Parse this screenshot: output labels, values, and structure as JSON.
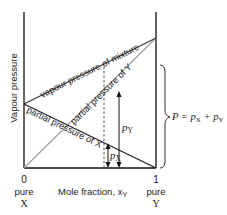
{
  "diagram": {
    "type": "vapour-pressure-composition diagram (ideal binary mixture, Raoult's law)",
    "y_axis": {
      "label": "Vapour pressure"
    },
    "x_axis": {
      "label": "Mole fraction, x",
      "label_subscript": "Y",
      "left_tick": {
        "value": "0",
        "component_line1": "pure",
        "component_line2": "X"
      },
      "right_tick": {
        "value": "1",
        "component_line1": "pure",
        "component_line2": "Y"
      }
    },
    "lines": [
      {
        "id": "total",
        "label": "vapour pressure of mixture",
        "color": "#333333"
      },
      {
        "id": "partial_y",
        "label": "partial pressure of Y",
        "color": "#999999"
      },
      {
        "id": "partial_x",
        "label": "partial pressure of X",
        "color": "#222222"
      }
    ],
    "annotations": {
      "px_label": "p",
      "px_sub": "X",
      "py_label": "p",
      "py_sub": "Y",
      "total_eq_P": "P",
      "total_eq_mid": " = p",
      "total_eq_sub1": "X",
      "total_eq_plus": " + p",
      "total_eq_sub2": "Y"
    },
    "colors": {
      "axis": "#111111",
      "total_line": "#333333",
      "partial_y_line": "#9a9a9a",
      "partial_x_line": "#222222",
      "text": "#222222"
    }
  }
}
